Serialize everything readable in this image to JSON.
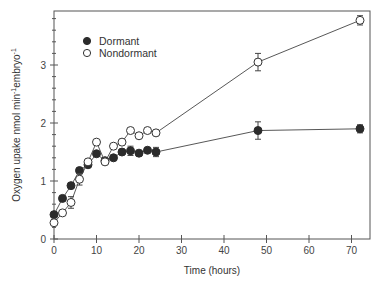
{
  "chart_data": {
    "type": "line",
    "title": "",
    "xlabel": "Time (hours)",
    "ylabel": "Oxygen upake nmol min⁻¹embryo⁻¹",
    "ylabel_parts": {
      "main": "Oxygen upake nmol min",
      "sup1": "-1",
      "mid": "embryo",
      "sup2": "-1"
    },
    "xlim": [
      0,
      74
    ],
    "ylim": [
      0,
      3.9
    ],
    "xticks": [
      0,
      10,
      20,
      30,
      40,
      50,
      60,
      70
    ],
    "yticks": [
      0,
      1,
      2,
      3
    ],
    "y_minor_step": 0.2,
    "grid": false,
    "legend_position": "upper-left",
    "x": [
      0,
      2,
      4,
      6,
      8,
      10,
      12,
      14,
      16,
      18,
      20,
      22,
      24,
      48,
      72
    ],
    "series": [
      {
        "name": "Dormant",
        "marker": "filled-circle",
        "values": [
          0.42,
          0.7,
          0.92,
          1.18,
          1.28,
          1.47,
          1.35,
          1.4,
          1.5,
          1.52,
          1.48,
          1.53,
          1.5,
          1.87,
          1.9
        ],
        "errors": [
          0.03,
          0.03,
          0.04,
          0.05,
          0.05,
          0.05,
          0.04,
          0.06,
          0.06,
          0.08,
          0.05,
          0.04,
          0.08,
          0.15,
          0.07
        ]
      },
      {
        "name": "Nondormant",
        "marker": "open-circle",
        "values": [
          0.28,
          0.45,
          0.63,
          1.03,
          1.33,
          1.67,
          1.33,
          1.6,
          1.67,
          1.87,
          1.78,
          1.87,
          1.83,
          3.05,
          3.77
        ],
        "errors": [
          0.02,
          0.03,
          0.1,
          0.1,
          0.04,
          0.04,
          0.03,
          0.03,
          0.03,
          0.03,
          0.03,
          0.03,
          0.03,
          0.15,
          0.08
        ]
      }
    ]
  },
  "legend": {
    "items": [
      {
        "label": "Dormant",
        "marker": "filled-circle"
      },
      {
        "label": "Nondormant",
        "marker": "open-circle"
      }
    ]
  },
  "colors": {
    "axis": "#555555",
    "dormant_fill": "#2b2b2b",
    "nondormant_fill": "#ffffff",
    "line": "#444444"
  }
}
